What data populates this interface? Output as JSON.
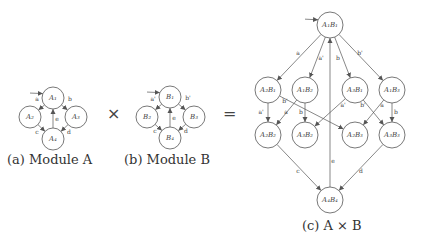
{
  "operators": {
    "times": "×",
    "equals": "="
  },
  "module_a": {
    "caption": "(a) Module A",
    "nodes": [
      {
        "id": "A1",
        "label": "A₁",
        "x": 53,
        "y": 98,
        "r": 11,
        "initial": true
      },
      {
        "id": "A2",
        "label": "A₂",
        "x": 30,
        "y": 117,
        "r": 11
      },
      {
        "id": "A3",
        "label": "A₃",
        "x": 76,
        "y": 117,
        "r": 11
      },
      {
        "id": "A4",
        "label": "A₄",
        "x": 53,
        "y": 139,
        "r": 11
      }
    ],
    "edges": [
      {
        "from": "A1",
        "to": "A2",
        "label": "a",
        "lx": 37,
        "ly": 101
      },
      {
        "from": "A1",
        "to": "A3",
        "label": "b",
        "lx": 70,
        "ly": 101
      },
      {
        "from": "A4",
        "to": "A1",
        "label": "e",
        "lx": 57,
        "ly": 121
      },
      {
        "from": "A2",
        "to": "A4",
        "label": "c",
        "lx": 37,
        "ly": 134
      },
      {
        "from": "A3",
        "to": "A4",
        "label": "d",
        "lx": 69,
        "ly": 134
      }
    ]
  },
  "module_b": {
    "caption": "(b) Module B",
    "nodes": [
      {
        "id": "B1",
        "label": "B₁",
        "x": 170,
        "y": 97,
        "r": 11,
        "initial": true
      },
      {
        "id": "B2",
        "label": "B₂",
        "x": 147,
        "y": 117,
        "r": 11
      },
      {
        "id": "B3",
        "label": "B₃",
        "x": 194,
        "y": 117,
        "r": 11
      },
      {
        "id": "B4",
        "label": "B₄",
        "x": 170,
        "y": 138,
        "r": 11
      }
    ],
    "edges": [
      {
        "from": "B1",
        "to": "B2",
        "label": "a'",
        "lx": 153,
        "ly": 101
      },
      {
        "from": "B1",
        "to": "B3",
        "label": "b'",
        "lx": 188,
        "ly": 100
      },
      {
        "from": "B4",
        "to": "B1",
        "label": "e",
        "lx": 174,
        "ly": 120
      },
      {
        "from": "B2",
        "to": "B4",
        "label": "c",
        "lx": 155,
        "ly": 133
      },
      {
        "from": "B3",
        "to": "B4",
        "label": "d",
        "lx": 186,
        "ly": 133
      }
    ]
  },
  "product": {
    "caption": "(c) A × B",
    "nodes": [
      {
        "id": "A1B1",
        "label": "A₁B₁",
        "x": 330,
        "y": 25,
        "r": 13,
        "initial": true
      },
      {
        "id": "A2B1",
        "label": "A₂B₁",
        "x": 268,
        "y": 90,
        "r": 13
      },
      {
        "id": "A1B2",
        "label": "A₁B₂",
        "x": 305,
        "y": 90,
        "r": 13
      },
      {
        "id": "A3B1",
        "label": "A₃B₁",
        "x": 355,
        "y": 90,
        "r": 13
      },
      {
        "id": "A1B3",
        "label": "A₁B₃",
        "x": 392,
        "y": 90,
        "r": 13
      },
      {
        "id": "A2B2",
        "label": "A₂B₂",
        "x": 268,
        "y": 135,
        "r": 13
      },
      {
        "id": "A3B2",
        "label": "A₃B₂",
        "x": 305,
        "y": 135,
        "r": 13
      },
      {
        "id": "A2B3",
        "label": "A₂B₃",
        "x": 355,
        "y": 135,
        "r": 13
      },
      {
        "id": "A3B3",
        "label": "A₃B₃",
        "x": 392,
        "y": 135,
        "r": 13
      },
      {
        "id": "A4B4",
        "label": "A₄B₄",
        "x": 330,
        "y": 200,
        "r": 13
      }
    ],
    "edges": [
      {
        "from": "A1B1",
        "to": "A2B1",
        "label": "a",
        "lx": 298,
        "ly": 55
      },
      {
        "from": "A1B1",
        "to": "A1B2",
        "label": "a'",
        "lx": 321,
        "ly": 60
      },
      {
        "from": "A1B1",
        "to": "A3B1",
        "label": "b",
        "lx": 338,
        "ly": 60
      },
      {
        "from": "A1B1",
        "to": "A1B3",
        "label": "b'",
        "lx": 360,
        "ly": 55
      },
      {
        "from": "A2B1",
        "to": "A2B2",
        "label": "a'",
        "lx": 261,
        "ly": 114
      },
      {
        "from": "A2B1",
        "to": "A2B3",
        "label": "b'",
        "lx": 285,
        "ly": 103
      },
      {
        "from": "A1B2",
        "to": "A2B2",
        "label": "a",
        "lx": 286,
        "ly": 114
      },
      {
        "from": "A1B2",
        "to": "A3B2",
        "label": "b",
        "lx": 301,
        "ly": 114
      },
      {
        "from": "A3B1",
        "to": "A3B2",
        "label": "a'",
        "lx": 343,
        "ly": 107
      },
      {
        "from": "A3B1",
        "to": "A3B3",
        "label": "b'",
        "lx": 363,
        "ly": 107
      },
      {
        "from": "A1B3",
        "to": "A2B3",
        "label": "a",
        "lx": 382,
        "ly": 107
      },
      {
        "from": "A1B3",
        "to": "A3B3",
        "label": "b",
        "lx": 396,
        "ly": 114
      },
      {
        "from": "A4B4",
        "to": "A1B1",
        "label": "e",
        "lx": 333,
        "ly": 163
      },
      {
        "from": "A2B2",
        "to": "A4B4",
        "label": "c",
        "lx": 298,
        "ly": 173
      },
      {
        "from": "A3B3",
        "to": "A4B4",
        "label": "d",
        "lx": 361,
        "ly": 173
      }
    ]
  }
}
